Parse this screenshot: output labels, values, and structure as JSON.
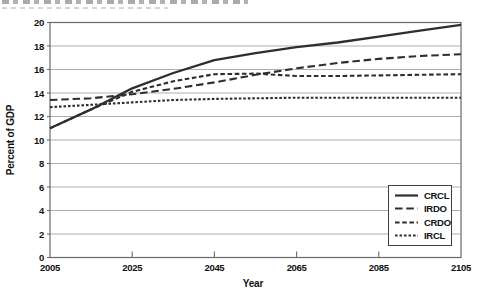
{
  "page": {
    "top_clipped_text": {
      "present": true,
      "legible": false,
      "note": "bottom sliver of a cut-off text line at top edge of screenshot"
    }
  },
  "chart_data": {
    "type": "line",
    "title": "",
    "xlabel": "Year",
    "ylabel": "Percent of GDP",
    "x": [
      2005,
      2015,
      2025,
      2035,
      2045,
      2055,
      2065,
      2075,
      2085,
      2095,
      2105
    ],
    "xlim": [
      2005,
      2105
    ],
    "ylim": [
      0,
      20
    ],
    "x_ticks": [
      2005,
      2025,
      2045,
      2065,
      2085,
      2105
    ],
    "y_ticks": [
      0,
      2,
      4,
      6,
      8,
      10,
      12,
      14,
      16,
      18,
      20
    ],
    "grid": "horizontal",
    "legend_position": "inside-bottom-right",
    "series": [
      {
        "name": "CRCL",
        "style": "solid",
        "values": [
          11.0,
          12.6,
          14.4,
          15.7,
          16.8,
          17.4,
          17.9,
          18.3,
          18.8,
          19.3,
          19.8
        ]
      },
      {
        "name": "IRDO",
        "style": "long-dash",
        "values": [
          13.4,
          13.55,
          13.9,
          14.35,
          14.9,
          15.55,
          16.1,
          16.55,
          16.9,
          17.15,
          17.3
        ]
      },
      {
        "name": "CRDO",
        "style": "medium-dash",
        "values": [
          11.0,
          12.6,
          14.1,
          15.0,
          15.6,
          15.65,
          15.45,
          15.45,
          15.5,
          15.55,
          15.6
        ]
      },
      {
        "name": "IRCL",
        "style": "short-dash",
        "values": [
          12.8,
          13.0,
          13.2,
          13.4,
          13.5,
          13.55,
          13.6,
          13.6,
          13.6,
          13.6,
          13.6
        ]
      }
    ],
    "colors": {
      "line": "#2e2e2e",
      "grid": "#a6a6a6",
      "frame": "#6b6b6b",
      "text": "#111111",
      "background": "#ffffff"
    }
  }
}
